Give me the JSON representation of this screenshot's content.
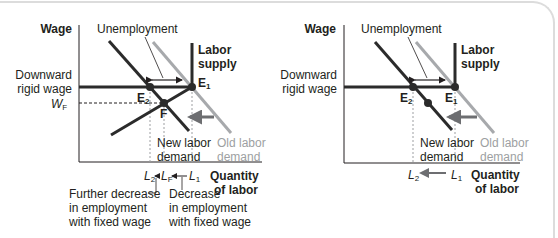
{
  "colors": {
    "curve": "#2b2b2b",
    "old_demand": "#a7a9ac",
    "shift_arrow": "#6d6e71",
    "dashed": "#8a8a8a",
    "frame": "#dcdcdc"
  },
  "left_panel": {
    "y_axis_label": "Wage",
    "x_axis_label_line1": "Quantity",
    "x_axis_label_line2": "of labor",
    "rigid_wage_line1": "Downward",
    "rigid_wage_line2": "rigid wage",
    "wf_label": "W",
    "wf_sub": "F",
    "unemployment_label": "Unemployment",
    "supply_line1": "Labor",
    "supply_line2": "supply",
    "e1_label": "E",
    "e1_sub": "1",
    "e2_label": "E",
    "e2_sub": "2",
    "f_label": "F",
    "new_demand_line1": "New labor",
    "new_demand_line2": "demand",
    "old_demand_line1": "Old labor",
    "old_demand_line2": "demand",
    "l2_label": "L",
    "l2_sub": "2",
    "lf_label": "L",
    "lf_sub": "F",
    "l1_label": "L",
    "l1_sub": "1",
    "note_left": [
      "Further decrease",
      "in employment",
      "with fixed wage"
    ],
    "note_right": [
      "Decrease",
      "in employment",
      "with fixed wage"
    ]
  },
  "right_panel": {
    "y_axis_label": "Wage",
    "x_axis_label_line1": "Quantity",
    "x_axis_label_line2": "of labor",
    "rigid_wage_line1": "Downward",
    "rigid_wage_line2": "rigid wage",
    "unemployment_label": "Unemployment",
    "supply_line1": "Labor",
    "supply_line2": "supply",
    "e1_label": "E",
    "e1_sub": "1",
    "e2_label": "E",
    "e2_sub": "2",
    "new_demand_line1": "New labor",
    "new_demand_line2": "demand",
    "old_demand_line1": "Old labor",
    "old_demand_line2": "demand",
    "l2_label": "L",
    "l2_sub": "2",
    "l1_label": "L",
    "l1_sub": "1"
  }
}
